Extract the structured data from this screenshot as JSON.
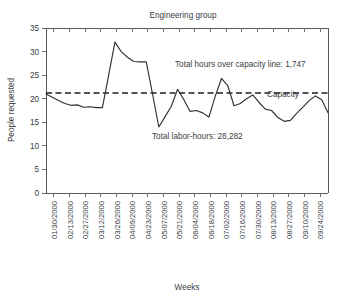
{
  "chart_data": {
    "type": "line",
    "title": "Engineering group",
    "xlabel": "Weeks",
    "ylabel": "People requested",
    "ylim": [
      0,
      35
    ],
    "ytick_values": [
      0,
      5,
      10,
      15,
      20,
      25,
      30,
      35
    ],
    "ytick_labels": [
      "0",
      "5",
      "10",
      "15",
      "20",
      "25",
      "30",
      "35"
    ],
    "grid": false,
    "legend": "none",
    "xtick_labels": [
      "01/30/2000",
      "02/13/2000",
      "02/27/2000",
      "03/12/2000",
      "03/26/2000",
      "04/09/2000",
      "04/23/2000",
      "05/07/2000",
      "05/21/2000",
      "06/04/2000",
      "06/18/2000",
      "07/02/2000",
      "07/16/2000",
      "07/30/2000",
      "08/13/2000",
      "08/27/2000",
      "09/10/2000",
      "09/24/2000"
    ],
    "series": [
      {
        "name": "People requested",
        "style": "solid",
        "values": [
          21.0,
          20.3,
          19.6,
          19.0,
          18.6,
          18.7,
          18.2,
          18.3,
          18.1,
          18.1,
          25.0,
          32.0,
          30.0,
          28.8,
          27.9,
          27.8,
          27.8,
          21.0,
          14.0,
          16.2,
          18.4,
          22.0,
          19.8,
          17.3,
          17.5,
          17.0,
          16.1,
          20.5,
          24.3,
          22.8,
          18.5,
          19.0,
          20.0,
          20.8,
          19.2,
          17.8,
          17.5,
          16.0,
          15.2,
          15.4,
          16.9,
          18.2,
          19.6,
          20.6,
          19.8,
          17.0
        ]
      },
      {
        "name": "Capacity",
        "style": "dashed",
        "constant": 21.2
      }
    ],
    "annotations": [
      {
        "name": "total-hours-over-capacity",
        "text": "Total hours over capacity line: 1,747"
      },
      {
        "name": "total-labor-hours",
        "text": "Total labor-hours: 28,282"
      },
      {
        "name": "capacity-label",
        "text": "Capacity"
      }
    ]
  }
}
